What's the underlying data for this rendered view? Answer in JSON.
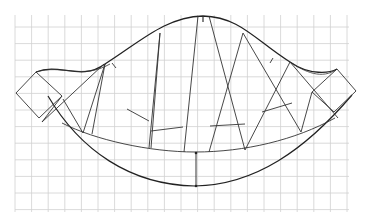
{
  "diagram": {
    "title": "",
    "type": "pattern-construction-on-grid",
    "grid": {
      "x0": 15,
      "y0": 15,
      "x1": 349,
      "y1": 212,
      "step": 16.6,
      "color": "#d0d0d0"
    },
    "colors": {
      "line": "#333333",
      "curve": "#222222",
      "grid": "#d0d0d0"
    },
    "top_curve": "M36,72 C60,62 80,82 105,64 C140,42 165,17 203,16 C240,17 255,40 290,62 C310,76 330,73 337,69",
    "top_curve_inner": "M36,72 C62,64 82,80 110,64 M290,62 C305,72 322,80 337,69",
    "outer_bottom_curve": "M48,96 C80,150 130,185 195,186 C255,185 305,150 352,95",
    "inner_bottom_curve": "M62,123 C95,140 150,152 195,152 C245,152 295,140 335,118",
    "left_box": [
      [
        36,
        72
      ],
      [
        16,
        93
      ],
      [
        39,
        118
      ],
      [
        62,
        96
      ]
    ],
    "right_box": [
      [
        337,
        69
      ],
      [
        356,
        91
      ],
      [
        334,
        112
      ],
      [
        312,
        92
      ]
    ],
    "panels": [
      {
        "top": [
          [
            105,
            64
          ],
          [
            62,
            96
          ]
        ],
        "bottom": [
          [
            83,
            133
          ],
          [
            42,
            122
          ]
        ]
      },
      {
        "top": [
          [
            160,
            33
          ],
          [
            105,
            64
          ]
        ],
        "bottom": [
          [
            149,
            148
          ],
          [
            92,
            134
          ]
        ]
      },
      {
        "top": [
          [
            198,
            16
          ],
          [
            160,
            33
          ]
        ],
        "bottom": [
          [
            184,
            152
          ],
          [
            151,
            148
          ]
        ]
      },
      {
        "top": [
          [
            209,
            16
          ],
          [
            243,
            33
          ]
        ],
        "bottom": [
          [
            245,
            150
          ],
          [
            209,
            152
          ]
        ]
      },
      {
        "top": [
          [
            243,
            33
          ],
          [
            290,
            62
          ]
        ],
        "bottom": [
          [
            301,
            132
          ],
          [
            245,
            150
          ]
        ]
      },
      {
        "top": [
          [
            290,
            62
          ],
          [
            312,
            92
          ]
        ],
        "bottom": [
          [
            338,
            118
          ],
          [
            301,
            132
          ]
        ]
      }
    ],
    "cross_lines": [
      [
        [
          63,
          99
        ],
        [
          83,
          133
        ]
      ],
      [
        [
          104,
          64
        ],
        [
          42,
          122
        ]
      ],
      [
        [
          127,
          109
        ],
        [
          149,
          121
        ]
      ],
      [
        [
          151,
          131
        ],
        [
          183,
          127
        ]
      ],
      [
        [
          210,
          126
        ],
        [
          245,
          124
        ]
      ],
      [
        [
          262,
          112
        ],
        [
          292,
          103
        ]
      ]
    ],
    "center_dimension": {
      "x": 196,
      "y_top": 153,
      "y_bottom": 186
    }
  }
}
